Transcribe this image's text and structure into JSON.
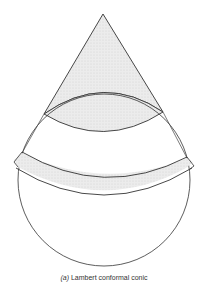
{
  "figure": {
    "caption_label": "(a)",
    "caption_text": "Lambert conformal conic",
    "colors": {
      "stroke": "#333333",
      "shade": "#e6e6e6",
      "background": "#ffffff"
    }
  }
}
